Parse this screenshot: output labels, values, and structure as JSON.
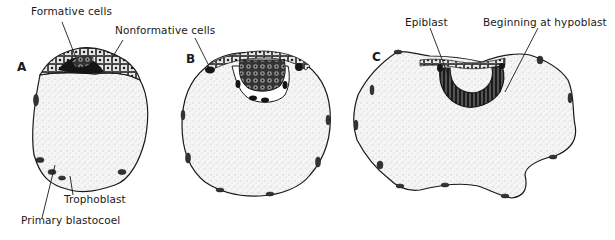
{
  "figure": {
    "panels": [
      {
        "letter": "A",
        "labels": {
          "formative": "Formative cells",
          "nonformative": "Nonformative cells",
          "trophoblast": "Trophoblast",
          "blastocoel": "Primary blastocoel"
        }
      },
      {
        "letter": "B"
      },
      {
        "letter": "C",
        "labels": {
          "epiblast": "Epiblast",
          "hypoblast": "Beginning at hypoblast"
        }
      }
    ],
    "colors": {
      "ink": "#1a1a1a",
      "stipple_fill": "#f4f4f4",
      "dark_mass": "#151515",
      "background": "#ffffff"
    }
  }
}
